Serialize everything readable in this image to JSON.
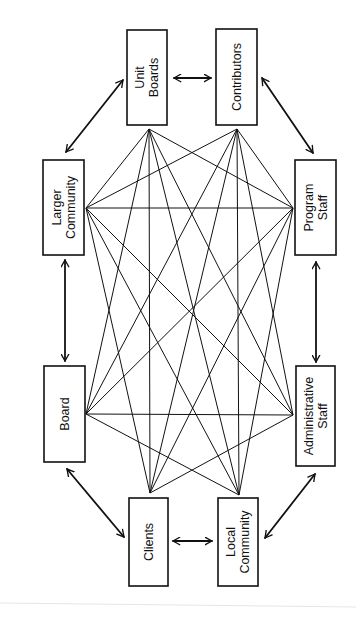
{
  "diagram": {
    "title": "",
    "orientation": "rotated-90-ccw",
    "line_color": "#111111",
    "nodes": [
      {
        "id": "unit_boards",
        "label": "Unit Boards",
        "lines": [
          "Unit",
          "Boards"
        ],
        "box": [
          127,
          30,
          40,
          95
        ],
        "anchor": [
          149,
          129
        ]
      },
      {
        "id": "contributors",
        "label": "Contributors",
        "lines": [
          "Contributors"
        ],
        "box": [
          216,
          29,
          41,
          96
        ],
        "anchor": [
          237,
          129
        ]
      },
      {
        "id": "larger_community",
        "label": "Larger Community",
        "lines": [
          "Larger",
          "Community"
        ],
        "box": [
          43,
          160,
          41,
          95
        ],
        "anchor": [
          86,
          208
        ]
      },
      {
        "id": "program_staff",
        "label": "Program Staff",
        "lines": [
          "Program",
          "Staff"
        ],
        "box": [
          295,
          160,
          41,
          95
        ],
        "anchor": [
          293,
          208
        ]
      },
      {
        "id": "board",
        "label": "Board",
        "lines": [
          "Board"
        ],
        "box": [
          44,
          366,
          41,
          96
        ],
        "anchor": [
          86,
          414
        ]
      },
      {
        "id": "administrative_staff",
        "label": "Administrative Staff",
        "lines": [
          "Administrative",
          "Staff"
        ],
        "box": [
          296,
          366,
          39,
          100
        ],
        "anchor": [
          293,
          415
        ]
      },
      {
        "id": "clients",
        "label": "Clients",
        "lines": [
          "Clients"
        ],
        "box": [
          129,
          498,
          39,
          88
        ],
        "anchor": [
          150,
          493
        ]
      },
      {
        "id": "local_community",
        "label": "Local Community",
        "lines": [
          "Local",
          "Community"
        ],
        "box": [
          218,
          498,
          40,
          88
        ],
        "anchor": [
          239,
          495
        ]
      }
    ],
    "arrows": [
      {
        "from": "unit_boards",
        "to": "contributors",
        "x1": 174,
        "y1": 78,
        "x2": 211,
        "y2": 78
      },
      {
        "from": "larger_community",
        "to": "unit_boards",
        "x1": 66,
        "y1": 152,
        "x2": 123,
        "y2": 80
      },
      {
        "from": "contributors",
        "to": "program_staff",
        "x1": 262,
        "y1": 78,
        "x2": 313,
        "y2": 153
      },
      {
        "from": "larger_community",
        "to": "board",
        "x1": 65,
        "y1": 260,
        "x2": 65,
        "y2": 361
      },
      {
        "from": "program_staff",
        "to": "administrative_staff",
        "x1": 316,
        "y1": 262,
        "x2": 316,
        "y2": 362
      },
      {
        "from": "board",
        "to": "clients",
        "x1": 67,
        "y1": 469,
        "x2": 124,
        "y2": 537
      },
      {
        "from": "administrative_staff",
        "to": "local_community",
        "x1": 315,
        "y1": 474,
        "x2": 265,
        "y2": 538
      },
      {
        "from": "clients",
        "to": "local_community",
        "x1": 173,
        "y1": 541,
        "x2": 212,
        "y2": 541
      }
    ],
    "links": [
      [
        "unit_boards",
        "larger_community"
      ],
      [
        "unit_boards",
        "program_staff"
      ],
      [
        "unit_boards",
        "board"
      ],
      [
        "unit_boards",
        "administrative_staff"
      ],
      [
        "unit_boards",
        "clients"
      ],
      [
        "unit_boards",
        "local_community"
      ],
      [
        "contributors",
        "larger_community"
      ],
      [
        "contributors",
        "program_staff"
      ],
      [
        "contributors",
        "board"
      ],
      [
        "contributors",
        "administrative_staff"
      ],
      [
        "contributors",
        "clients"
      ],
      [
        "contributors",
        "local_community"
      ],
      [
        "larger_community",
        "program_staff"
      ],
      [
        "larger_community",
        "administrative_staff"
      ],
      [
        "larger_community",
        "clients"
      ],
      [
        "larger_community",
        "local_community"
      ],
      [
        "program_staff",
        "board"
      ],
      [
        "program_staff",
        "clients"
      ],
      [
        "program_staff",
        "local_community"
      ],
      [
        "board",
        "administrative_staff"
      ],
      [
        "board",
        "local_community"
      ],
      [
        "administrative_staff",
        "clients"
      ]
    ]
  }
}
